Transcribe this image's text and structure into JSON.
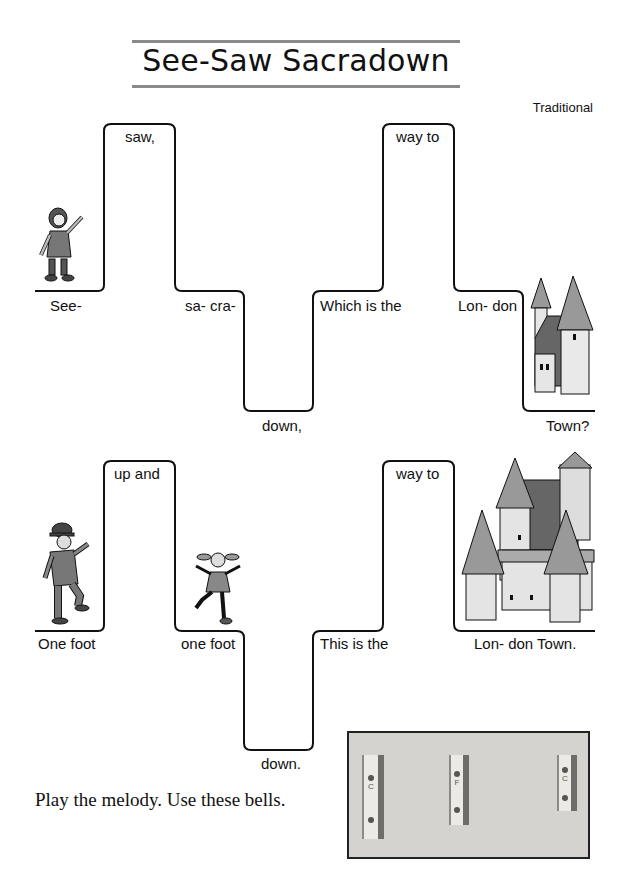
{
  "page": {
    "title": "See-Saw Sacradown",
    "credit": "Traditional",
    "instruction": "Play the melody. Use these bells."
  },
  "lines": [
    {
      "lyrics": [
        "See-",
        "saw,",
        "sa- cra-",
        "down,",
        "Which is the",
        "way to",
        "Lon- don",
        "Town?"
      ],
      "illustrations": [
        "girl-pointing",
        "small-castle"
      ]
    },
    {
      "lyrics": [
        "One foot",
        "up and",
        "one foot",
        "down.",
        "This is the",
        "way to",
        "Lon- don Town."
      ],
      "illustrations": [
        "man-in-bowler-hat",
        "girl-jumping",
        "large-castle"
      ]
    }
  ],
  "bells": [
    {
      "note": "C"
    },
    {
      "note": "F"
    },
    {
      "note": "C"
    }
  ],
  "colors": {
    "line": "#111111",
    "rule": "#8a8a8a",
    "photo_bg": "#d4d3cf"
  }
}
